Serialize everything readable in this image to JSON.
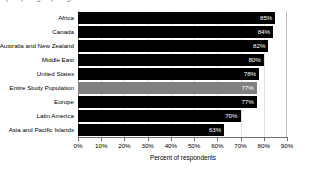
{
  "clipped_header": {
    "remnant_text": "p p g p g"
  },
  "chart_data": {
    "type": "bar",
    "orientation": "horizontal",
    "title": "",
    "xlabel": "Percent of respondents",
    "ylabel": "",
    "categories": [
      "Africa",
      "Canada",
      "Australia and New Zealand",
      "Middle East",
      "United States",
      "Entire Study Population",
      "Europe",
      "Latin America",
      "Asia and Pacific Islands"
    ],
    "values": [
      85,
      84,
      82,
      80,
      78,
      77,
      77,
      70,
      63
    ],
    "value_labels": [
      "85%",
      "84%",
      "82%",
      "80%",
      "78%",
      "77%",
      "77%",
      "70%",
      "63%"
    ],
    "bar_colors": [
      "#000000",
      "#000000",
      "#000000",
      "#000000",
      "#000000",
      "#808080",
      "#000000",
      "#000000",
      "#000000"
    ],
    "highlight_category": "Entire Study Population",
    "highlight_color": "#808080",
    "bar_color": "#000000",
    "data_label_color": "#ffffff",
    "xlim": [
      0,
      90
    ],
    "xticks": [
      0,
      10,
      20,
      30,
      40,
      50,
      60,
      70,
      80,
      90
    ],
    "xtick_labels": [
      "0%",
      "10%",
      "20%",
      "30%",
      "40%",
      "50%",
      "60%",
      "70%",
      "80%",
      "90%"
    ],
    "grid": true,
    "grid_axis": "x",
    "grid_color": "#e2e2e2",
    "legend": null,
    "background_color": "#ffffff"
  }
}
